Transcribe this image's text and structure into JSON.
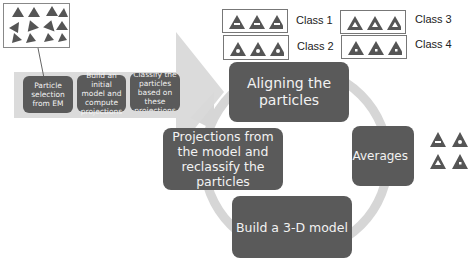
{
  "particle_panel": {
    "icon": "particle-triangles"
  },
  "pipeline": {
    "steps": [
      {
        "label": "Particle selection from EM"
      },
      {
        "label": "Build an initial model and compute projections"
      },
      {
        "label": "Classify the particles based on these projections"
      }
    ]
  },
  "classes": [
    {
      "label": "Class 1",
      "glyph": "bar"
    },
    {
      "label": "Class 2",
      "glyph": "dot"
    },
    {
      "label": "Class 3",
      "glyph": "hollow"
    },
    {
      "label": "Class 4",
      "glyph": "dot-small"
    }
  ],
  "cycle": {
    "aligning": "Aligning the particles",
    "class_averages": "Class Averages",
    "projections": "Projections from the model and reclassify the particles",
    "build_model": "Build a  3-D model"
  },
  "colors": {
    "box": "#5a5a5a",
    "band": "#d9d9d9",
    "ring": "#d6d6d6",
    "triangle": "#555555"
  }
}
